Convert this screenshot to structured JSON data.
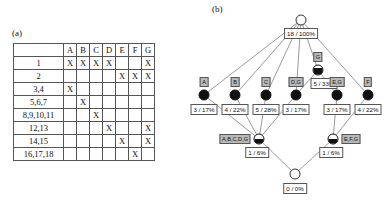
{
  "panel_a": {
    "caption": "(a)",
    "matrix": {
      "corner": "",
      "columns": [
        "A",
        "B",
        "C",
        "D",
        "E",
        "F",
        "G"
      ],
      "mark": "X",
      "rows": [
        {
          "label": "1",
          "marks": [
            "X",
            "X",
            "X",
            "X",
            "",
            "",
            "X"
          ]
        },
        {
          "label": "2",
          "marks": [
            "",
            "",
            "",
            "",
            "X",
            "X",
            "X"
          ]
        },
        {
          "label": "3,4",
          "marks": [
            "X",
            "",
            "",
            "",
            "",
            "",
            ""
          ]
        },
        {
          "label": "5,6,7",
          "marks": [
            "",
            "X",
            "",
            "",
            "",
            "",
            ""
          ]
        },
        {
          "label": "8,9,10,11",
          "marks": [
            "",
            "",
            "X",
            "",
            "",
            "",
            ""
          ]
        },
        {
          "label": "12,13",
          "marks": [
            "",
            "",
            "",
            "X",
            "",
            "",
            "X"
          ]
        },
        {
          "label": "14,15",
          "marks": [
            "",
            "",
            "",
            "",
            "X",
            "",
            "X"
          ]
        },
        {
          "label": "16,17,18",
          "marks": [
            "",
            "",
            "",
            "",
            "",
            "X",
            ""
          ]
        }
      ]
    }
  },
  "panel_b": {
    "caption": "(b)",
    "nodes": [
      {
        "id": "root",
        "glyph": "open",
        "tag": "",
        "stat": "18 / 100%",
        "x": 111,
        "y": 20,
        "stat_dx": 0,
        "stat_dy": 8,
        "tag_dx": 0,
        "tag_dy": 0
      },
      {
        "id": "g_mid",
        "glyph": "qtr",
        "tag": "G",
        "stat": "5 / 33%",
        "x": 128,
        "y": 70,
        "stat_dx": 6,
        "stat_dy": 8,
        "tag_dx": 0,
        "tag_dy": -13
      },
      {
        "id": "leafA",
        "glyph": "full",
        "tag": "A",
        "stat": "3 / 17%",
        "x": 14,
        "y": 95,
        "stat_dx": 0,
        "stat_dy": 9,
        "tag_dx": 0,
        "tag_dy": -13
      },
      {
        "id": "leafB",
        "glyph": "full",
        "tag": "B",
        "stat": "4 / 22%",
        "x": 45,
        "y": 95,
        "stat_dx": 0,
        "stat_dy": 9,
        "tag_dx": 0,
        "tag_dy": -13
      },
      {
        "id": "leafC",
        "glyph": "full",
        "tag": "C",
        "stat": "5 / 28%",
        "x": 76,
        "y": 95,
        "stat_dx": 0,
        "stat_dy": 9,
        "tag_dx": 0,
        "tag_dy": -13
      },
      {
        "id": "leafD",
        "glyph": "full",
        "tag": "D,G",
        "stat": "3 / 17%",
        "x": 106,
        "y": 95,
        "stat_dx": 0,
        "stat_dy": 9,
        "tag_dx": 0,
        "tag_dy": -13
      },
      {
        "id": "leafE",
        "glyph": "full",
        "tag": "E,G",
        "stat": "3 / 17%",
        "x": 147,
        "y": 95,
        "stat_dx": 0,
        "stat_dy": 9,
        "tag_dx": 0,
        "tag_dy": -13
      },
      {
        "id": "leafF",
        "glyph": "full",
        "tag": "F",
        "stat": "4 / 22%",
        "x": 178,
        "y": 95,
        "stat_dx": 0,
        "stat_dy": 9,
        "tag_dx": 0,
        "tag_dy": -13
      },
      {
        "id": "midL",
        "glyph": "half",
        "tag": "A,B,C,D,G",
        "stat": "1 / 6%",
        "x": 69,
        "y": 139,
        "stat_dx": -2,
        "stat_dy": 8,
        "tag_dx": -24,
        "tag_dy": 0
      },
      {
        "id": "midR",
        "glyph": "half",
        "tag": "E,F,G",
        "stat": "1 / 6%",
        "x": 143,
        "y": 139,
        "stat_dx": -2,
        "stat_dy": 8,
        "tag_dx": 18,
        "tag_dy": 0
      },
      {
        "id": "bot",
        "glyph": "open",
        "tag": "",
        "stat": "0 / 0%",
        "x": 105,
        "y": 174,
        "stat_dx": 0,
        "stat_dy": 9,
        "tag_dx": 0,
        "tag_dy": 0
      }
    ],
    "edges": [
      {
        "from": "root",
        "to": "leafA"
      },
      {
        "from": "root",
        "to": "leafB"
      },
      {
        "from": "root",
        "to": "leafC"
      },
      {
        "from": "root",
        "to": "leafD"
      },
      {
        "from": "root",
        "to": "g_mid"
      },
      {
        "from": "root",
        "to": "leafF"
      },
      {
        "from": "g_mid",
        "to": "leafD"
      },
      {
        "from": "g_mid",
        "to": "leafE"
      },
      {
        "from": "leafA",
        "to": "midL"
      },
      {
        "from": "leafB",
        "to": "midL"
      },
      {
        "from": "leafC",
        "to": "midL"
      },
      {
        "from": "leafD",
        "to": "midL"
      },
      {
        "from": "leafE",
        "to": "midR"
      },
      {
        "from": "leafF",
        "to": "midR"
      },
      {
        "from": "midL",
        "to": "bot"
      },
      {
        "from": "midR",
        "to": "bot"
      }
    ]
  },
  "colors": {
    "line": "#555555",
    "tag_bg": "#b9b9b9",
    "node_fill": "#111111",
    "background": "#ffffff"
  }
}
